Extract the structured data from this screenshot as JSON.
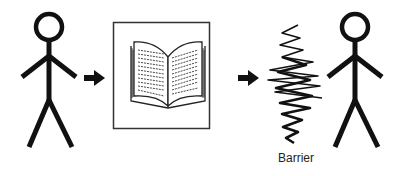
{
  "diagram": {
    "elements": [
      {
        "id": "sender",
        "type": "stick-figure",
        "role": "sender"
      },
      {
        "id": "arrow-1",
        "type": "arrow",
        "direction": "right"
      },
      {
        "id": "message",
        "type": "framed-image",
        "icon": "open-book-icon"
      },
      {
        "id": "arrow-2",
        "type": "arrow",
        "direction": "right"
      },
      {
        "id": "barrier",
        "type": "zigzag-scribble",
        "label": "Barrier"
      },
      {
        "id": "receiver",
        "type": "stick-figure",
        "role": "receiver"
      }
    ],
    "barrier_label": "Barrier",
    "colors": {
      "ink": "#111111",
      "background": "#ffffff"
    }
  }
}
